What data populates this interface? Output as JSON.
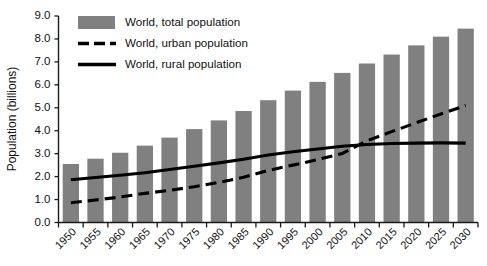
{
  "chart_data": {
    "type": "bar",
    "title": "",
    "xlabel": "",
    "ylabel": "Population (billions)",
    "ylim": [
      0.0,
      9.0
    ],
    "grid": false,
    "legend_position": "top-left",
    "categories": [
      "1950",
      "1955",
      "1960",
      "1965",
      "1970",
      "1975",
      "1980",
      "1985",
      "1990",
      "1995",
      "2000",
      "2005",
      "2010",
      "2015",
      "2020",
      "2025",
      "2030"
    ],
    "yticks": [
      "0.0",
      "1.0",
      "2.0",
      "3.0",
      "4.0",
      "5.0",
      "6.0",
      "7.0",
      "8.0",
      "9.0"
    ],
    "series": [
      {
        "name": "World, total population",
        "type": "bar",
        "color": "#808080",
        "values": [
          2.55,
          2.78,
          3.04,
          3.35,
          3.7,
          4.07,
          4.45,
          4.86,
          5.33,
          5.75,
          6.13,
          6.52,
          6.93,
          7.32,
          7.72,
          8.1,
          8.45
        ]
      },
      {
        "name": "World, urban population",
        "type": "line",
        "style": "dashed",
        "color": "#000000",
        "values": [
          0.86,
          0.98,
          1.11,
          1.27,
          1.4,
          1.56,
          1.75,
          1.97,
          2.27,
          2.5,
          2.74,
          3.01,
          3.56,
          3.96,
          4.35,
          4.73,
          5.1
        ]
      },
      {
        "name": "World, rural population",
        "type": "line",
        "style": "solid",
        "color": "#000000",
        "values": [
          1.86,
          1.96,
          2.06,
          2.17,
          2.31,
          2.45,
          2.6,
          2.76,
          2.94,
          3.08,
          3.2,
          3.32,
          3.4,
          3.44,
          3.46,
          3.47,
          3.46
        ]
      }
    ]
  },
  "legend": {
    "items": [
      {
        "label": "World, total population",
        "marker": "swatch"
      },
      {
        "label": "World, urban population",
        "marker": "dashed-line"
      },
      {
        "label": "World, rural population",
        "marker": "solid-line"
      }
    ]
  },
  "axes": {
    "y_title": "Population (billions)",
    "y_tick_labels": [
      "9.0",
      "8.0",
      "7.0",
      "6.0",
      "5.0",
      "4.0",
      "3.0",
      "2.0",
      "1.0",
      "0.0"
    ],
    "x_tick_labels": [
      "1950",
      "1955",
      "1960",
      "1965",
      "1970",
      "1975",
      "1980",
      "1985",
      "1990",
      "1995",
      "2000",
      "2005",
      "2010",
      "2015",
      "2020",
      "2025",
      "2030"
    ]
  },
  "footer": {
    "clipped_caption": ""
  }
}
